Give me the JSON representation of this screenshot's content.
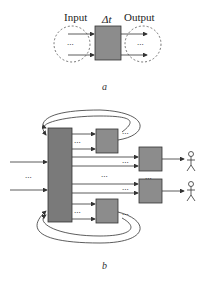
{
  "diagram_a": {
    "input_label": "Input",
    "output_label": "Output",
    "delta_label": "Δt",
    "ellipsis": "...",
    "caption": "a"
  },
  "diagram_b": {
    "ellipsis": "...",
    "caption": "b"
  },
  "colors": {
    "box_fill": "#8c8c8c",
    "big_bar_fill": "#7a7a7a",
    "stroke": "#333333",
    "dashed": "#555555"
  }
}
